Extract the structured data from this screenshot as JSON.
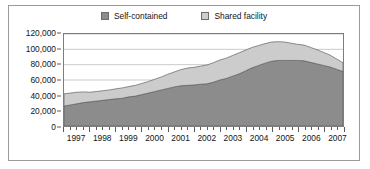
{
  "chart_data": {
    "type": "area",
    "stacked": true,
    "title": "",
    "subtitle": "",
    "xlabel": "",
    "ylabel": "",
    "ylim": [
      0,
      120000
    ],
    "ytick_labels": [
      "0",
      "20,000",
      "40,000",
      "60,000",
      "80,000",
      "100,000",
      "120,000"
    ],
    "ytick_values": [
      0,
      20000,
      40000,
      60000,
      80000,
      100000,
      120000
    ],
    "grid": true,
    "grid_axis": "y",
    "legend_position": "top-center",
    "xlim": [
      "1997 Q1",
      "2007 Q4"
    ],
    "categories": [
      "1997 Q1",
      "1997 Q2",
      "1997 Q3",
      "1997 Q4",
      "1998 Q1",
      "1998 Q2",
      "1998 Q3",
      "1998 Q4",
      "1999 Q1",
      "1999 Q2",
      "1999 Q3",
      "1999 Q4",
      "2000 Q1",
      "2000 Q2",
      "2000 Q3",
      "2000 Q4",
      "2001 Q1",
      "2001 Q2",
      "2001 Q3",
      "2001 Q4",
      "2002 Q1",
      "2002 Q2",
      "2002 Q3",
      "2002 Q4",
      "2003 Q1",
      "2003 Q2",
      "2003 Q3",
      "2003 Q4",
      "2004 Q1",
      "2004 Q2",
      "2004 Q3",
      "2004 Q4",
      "2005 Q1",
      "2005 Q2",
      "2005 Q3",
      "2005 Q4",
      "2006 Q1",
      "2006 Q2",
      "2006 Q3",
      "2006 Q4",
      "2007 Q1",
      "2007 Q2",
      "2007 Q3",
      "2007 Q4"
    ],
    "xtick_labels": [
      "1997",
      "1998",
      "1999",
      "2000",
      "2001",
      "2002",
      "2003",
      "2004",
      "2005",
      "2006",
      "2007"
    ],
    "series": [
      {
        "name": "Self-contained",
        "color": "#8c8c8c",
        "values": [
          26000,
          27500,
          29000,
          30500,
          31500,
          32500,
          33500,
          34500,
          35500,
          36200,
          38000,
          39000,
          41000,
          43000,
          45000,
          47000,
          49000,
          51000,
          52500,
          53000,
          53500,
          54500,
          55000,
          57000,
          60000,
          62000,
          65000,
          68000,
          72000,
          76000,
          79000,
          82000,
          84500,
          85500,
          85500,
          85500,
          85500,
          85000,
          83000,
          81000,
          79000,
          77000,
          74000,
          71000
        ]
      },
      {
        "name": "Shared facility",
        "color": "#cccccc",
        "values": [
          16000,
          15500,
          15000,
          14000,
          12500,
          12500,
          12500,
          12500,
          13000,
          13500,
          13500,
          14000,
          14500,
          15000,
          16000,
          17000,
          18500,
          19500,
          21000,
          22500,
          23000,
          23500,
          24500,
          25500,
          26000,
          26500,
          27000,
          27500,
          27000,
          26500,
          26000,
          25500,
          25000,
          24500,
          24000,
          22500,
          21000,
          20500,
          19500,
          18500,
          17000,
          15500,
          13500,
          11500
        ]
      }
    ]
  },
  "legend": {
    "items": [
      {
        "label": "Self-contained",
        "color": "#8c8c8c"
      },
      {
        "label": "Shared facility",
        "color": "#cccccc"
      }
    ]
  }
}
